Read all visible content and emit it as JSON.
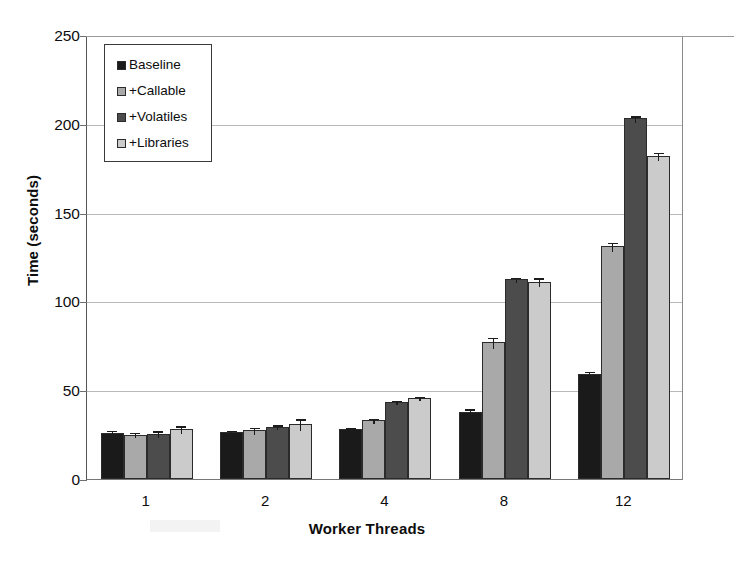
{
  "chart_data": {
    "type": "bar",
    "title": "",
    "xlabel": "Worker Threads",
    "ylabel": "Time (seconds)",
    "categories": [
      "1",
      "2",
      "4",
      "8",
      "12"
    ],
    "ylim": [
      0,
      250
    ],
    "yticks": [
      0,
      50,
      100,
      150,
      200,
      250
    ],
    "ytick_labels": [
      "0",
      "50",
      "100",
      "150",
      "200",
      "250"
    ],
    "grid": true,
    "legend_position": "upper left",
    "series": [
      {
        "name": "Baseline",
        "color": "#1a1a1a",
        "values": [
          26,
          26.5,
          28,
          38,
          59
        ],
        "errors": [
          1.6,
          1.3,
          1.0,
          1.8,
          1.8
        ]
      },
      {
        "name": "+Callable",
        "color": "#a9a9a9",
        "values": [
          25,
          27.5,
          33,
          77,
          131
        ],
        "errors": [
          1.5,
          2.0,
          1.3,
          3.2,
          2.4
        ]
      },
      {
        "name": "+Volatiles",
        "color": "#4c4c4c",
        "values": [
          25.5,
          29.5,
          43.5,
          112.5,
          203
        ],
        "errors": [
          2.0,
          1.2,
          1.1,
          1.4,
          1.8
        ]
      },
      {
        "name": "+Libraries",
        "color": "#cbcbcb",
        "values": [
          28,
          31,
          45.5,
          111,
          182
        ],
        "errors": [
          2.2,
          3.2,
          1.2,
          2.6,
          2.2
        ]
      }
    ]
  },
  "legend": {
    "entries": [
      {
        "label": "Baseline",
        "color": "#1a1a1a"
      },
      {
        "label": "+Callable",
        "color": "#a9a9a9"
      },
      {
        "label": "+Volatiles",
        "color": "#4c4c4c"
      },
      {
        "label": "+Libraries",
        "color": "#cbcbcb"
      }
    ]
  },
  "axes": {
    "y_title": "Time (seconds)",
    "x_title": "Worker Threads"
  }
}
